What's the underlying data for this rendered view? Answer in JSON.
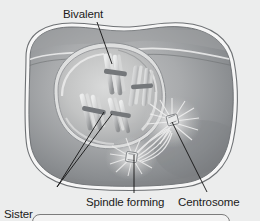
{
  "figure": {
    "background_color": "#eceded",
    "labels": {
      "bivalent": "Bivalent",
      "sister_chromatids_line1": "Sister",
      "sister_chromatids_line2": "chromatids",
      "spindle_forming": "Spindle forming",
      "centrosome": "Centrosome"
    },
    "parts": {
      "cell_membrane": "cell-membrane",
      "cytoplasm": "cytoplasm",
      "nuclear_envelope": "nuclear-envelope",
      "nucleoplasm": "nucleoplasm",
      "bivalent_chromosomes": "bivalent-chromosomes",
      "centrosome_upper": "centrosome-upper",
      "centrosome_lower": "centrosome-lower",
      "spindle_fibers": "spindle-fibers",
      "aster_rays": "aster-rays"
    },
    "colors": {
      "background": "#eceded",
      "cytoplasm_light": "#b9babb",
      "cytoplasm_dark": "#7d7f82",
      "membrane_outline": "#f4f4f4",
      "membrane_stroke": "#5d6063",
      "nucleus_light": "#cfd0d0",
      "nucleus_mid": "#a8a9ab",
      "chromosome_light": "#e6e7e7",
      "chromosome_dark": "#6e7174",
      "leader_line": "#121212",
      "text": "#1b1b1b"
    },
    "leader_lines": [
      {
        "name": "bivalent-leader",
        "x1": 97,
        "y1": 22,
        "x2": 112,
        "y2": 64
      },
      {
        "name": "sister-chromatids-leader-a",
        "x1": 57,
        "y1": 187,
        "x2": 104,
        "y2": 112
      },
      {
        "name": "sister-chromatids-leader-b",
        "x1": 57,
        "y1": 187,
        "x2": 112,
        "y2": 114
      },
      {
        "name": "spindle-forming-leader",
        "x1": 134,
        "y1": 193,
        "x2": 134,
        "y2": 155
      },
      {
        "name": "centrosome-leader",
        "x1": 207,
        "y1": 192,
        "x2": 172,
        "y2": 122
      }
    ]
  }
}
